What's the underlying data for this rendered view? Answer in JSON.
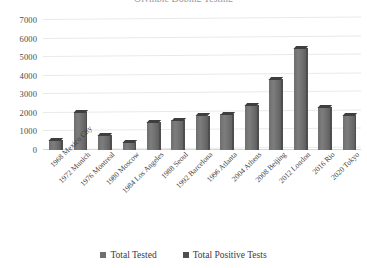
{
  "chart_data": {
    "type": "bar",
    "title": "Olympic Doping Testing",
    "xlabel": "",
    "ylabel": "",
    "ylim": [
      0,
      7000
    ],
    "ytick_step": 1000,
    "yticks": [
      "7000",
      "6000",
      "5000",
      "4000",
      "3000",
      "2000",
      "1000",
      "0"
    ],
    "grid": true,
    "legend_position": "bottom",
    "categories": [
      "1968 Mexico City",
      "1972 Munich",
      "1976 Montreal",
      "1980 Moscow",
      "1984 Los Angeles",
      "1988 Seoul",
      "1992 Barcelona",
      "1996 Atlanta",
      "2004 Athens",
      "2008 Beijing",
      "2012 London",
      "2016 Rio",
      "2020 Tokyo"
    ],
    "series": [
      {
        "name": "Total Tested",
        "color": "#6f6f6f",
        "values": [
          550,
          2050,
          790,
          440,
          1510,
          1600,
          1850,
          1920,
          2400,
          3800,
          5500,
          2300,
          1900
        ]
      },
      {
        "name": "Total Positive Tests",
        "color": "#4f4f4f",
        "values": [
          1,
          7,
          11,
          0,
          12,
          10,
          5,
          2,
          26,
          20,
          9,
          6,
          4
        ]
      }
    ]
  },
  "legend": {
    "items": [
      {
        "label": "Total Tested",
        "color": "#6f6f6f"
      },
      {
        "label": "Total Positive Tests",
        "color": "#4f4f4f"
      }
    ]
  }
}
